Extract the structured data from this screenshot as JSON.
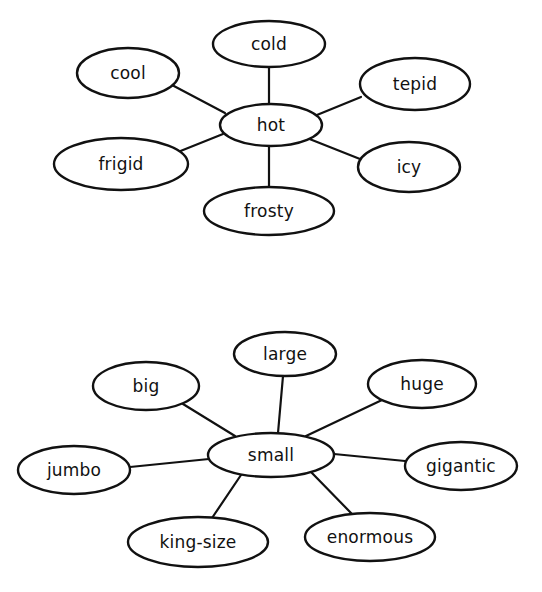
{
  "colors": {
    "background": "#ffffff",
    "stroke": "#111111",
    "text": "#111111"
  },
  "diagrams": [
    {
      "name": "hot-web",
      "center": {
        "label": "hot",
        "cx": 271,
        "cy": 125,
        "rx": 51,
        "ry": 21
      },
      "nodes": [
        {
          "label": "cold",
          "cx": 269,
          "cy": 44,
          "rx": 56,
          "ry": 23,
          "ex1": 269,
          "ey1": 104,
          "ex2": 269,
          "ey2": 67
        },
        {
          "label": "cool",
          "cx": 128,
          "cy": 73,
          "rx": 51,
          "ry": 25,
          "ex1": 225,
          "ey1": 113,
          "ex2": 172,
          "ey2": 85
        },
        {
          "label": "tepid",
          "cx": 415,
          "cy": 84,
          "rx": 55,
          "ry": 26,
          "ex1": 312,
          "ey1": 117,
          "ex2": 361,
          "ey2": 97
        },
        {
          "label": "frigid",
          "cx": 121,
          "cy": 164,
          "rx": 67,
          "ry": 26,
          "ex1": 223,
          "ey1": 134,
          "ex2": 178,
          "ey2": 152
        },
        {
          "label": "icy",
          "cx": 409,
          "cy": 167,
          "rx": 51,
          "ry": 25,
          "ex1": 307,
          "ey1": 138,
          "ex2": 360,
          "ey2": 159
        },
        {
          "label": "frosty",
          "cx": 269,
          "cy": 211,
          "rx": 65,
          "ry": 24,
          "ex1": 269,
          "ey1": 146,
          "ex2": 269,
          "ey2": 188
        }
      ]
    },
    {
      "name": "small-web",
      "center": {
        "label": "small",
        "cx": 271,
        "cy": 455,
        "rx": 63,
        "ry": 22
      },
      "nodes": [
        {
          "label": "large",
          "cx": 285,
          "cy": 354,
          "rx": 51,
          "ry": 22,
          "ex1": 278,
          "ey1": 433,
          "ex2": 283,
          "ey2": 376
        },
        {
          "label": "big",
          "cx": 146,
          "cy": 386,
          "rx": 53,
          "ry": 24,
          "ex1": 235,
          "ey1": 436,
          "ex2": 183,
          "ey2": 404
        },
        {
          "label": "huge",
          "cx": 422,
          "cy": 384,
          "rx": 54,
          "ry": 24,
          "ex1": 306,
          "ey1": 436,
          "ex2": 382,
          "ey2": 400
        },
        {
          "label": "jumbo",
          "cx": 74,
          "cy": 470,
          "rx": 56,
          "ry": 24,
          "ex1": 209,
          "ey1": 459,
          "ex2": 130,
          "ey2": 467
        },
        {
          "label": "gigantic",
          "cx": 461,
          "cy": 466,
          "rx": 56,
          "ry": 24,
          "ex1": 334,
          "ey1": 454,
          "ex2": 405,
          "ey2": 461
        },
        {
          "label": "king-size",
          "cx": 198,
          "cy": 542,
          "rx": 70,
          "ry": 25,
          "ex1": 241,
          "ey1": 475,
          "ex2": 212,
          "ey2": 518
        },
        {
          "label": "enormous",
          "cx": 370,
          "cy": 537,
          "rx": 65,
          "ry": 24,
          "ex1": 311,
          "ey1": 472,
          "ex2": 352,
          "ey2": 514
        }
      ]
    }
  ]
}
